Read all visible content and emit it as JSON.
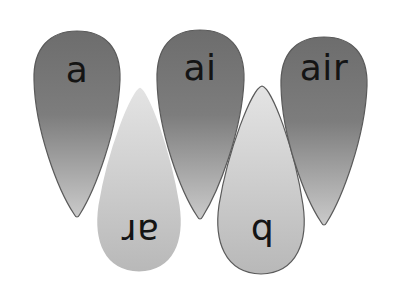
{
  "flower": {
    "colors": {
      "dark_petal_top": "#6f6f6f",
      "dark_petal_bottom": "#c4c4c4",
      "light_petal_top": "#e2e2e2",
      "light_petal_bottom": "#b9b9b9",
      "outline": "#5a5a5a",
      "text": "#141414",
      "background": "#ffffff"
    },
    "petals": [
      {
        "label": "a",
        "orientation": "up",
        "shade": "dark"
      },
      {
        "label": "ar",
        "orientation": "down",
        "shade": "light"
      },
      {
        "label": "ai",
        "orientation": "up",
        "shade": "dark"
      },
      {
        "label": "b",
        "orientation": "down",
        "shade": "light"
      },
      {
        "label": "air",
        "orientation": "up",
        "shade": "dark"
      }
    ]
  }
}
